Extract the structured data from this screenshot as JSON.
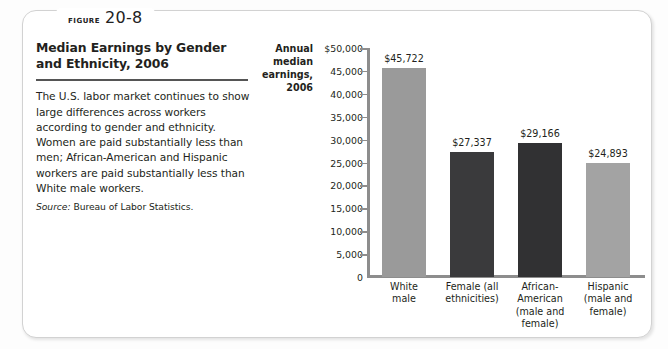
{
  "figure": {
    "label_word": "FIGURE",
    "number": "20-8",
    "title": "Median Earnings by Gender and Ethnicity, 2006",
    "body": "The U.S. labor market continues to show large differences across workers according to gender and ethnicity. Women are paid substantially less than men; African-American and Hispanic workers are paid substantially less than White male workers.",
    "source_label": "Source:",
    "source_text": "Bureau of Labor Statistics."
  },
  "chart_data": {
    "type": "bar",
    "title": "Median Earnings by Gender and Ethnicity, 2006",
    "ylabel": "Annual median earnings, 2006",
    "xlabel": "",
    "ylim": [
      0,
      50000
    ],
    "grid": false,
    "legend": "none",
    "ytick_labels": [
      "$50,000",
      "45,000",
      "40,000",
      "35,000",
      "30,000",
      "25,000",
      "20,000",
      "15,000",
      "10,000",
      "5,000",
      "0"
    ],
    "ytick_values": [
      50000,
      45000,
      40000,
      35000,
      30000,
      25000,
      20000,
      15000,
      10000,
      5000,
      0
    ],
    "categories": [
      "White male",
      "Female (all ethnicities)",
      "African-American (male and female)",
      "Hispanic (male and female)"
    ],
    "category_lines": [
      [
        "White",
        "male"
      ],
      [
        "Female (all",
        "ethnicities)"
      ],
      [
        "African-",
        "American",
        "(male and",
        "female)"
      ],
      [
        "Hispanic",
        "(male and",
        "female)"
      ]
    ],
    "values": [
      45722,
      27337,
      29166,
      24893
    ],
    "value_labels": [
      "$45,722",
      "$27,337",
      "$29,166",
      "$24,893"
    ],
    "bar_colors": [
      "#9a9a9a",
      "#3a3a3c",
      "#313133",
      "#a3a3a3"
    ]
  },
  "colors": {
    "card_border": "#d2d2d2",
    "axis": "#8d8d8d",
    "text": "#231f20",
    "rule": "#555555",
    "light_bar": "#9a9a9a",
    "dark_bar": "#3a3a3c"
  }
}
